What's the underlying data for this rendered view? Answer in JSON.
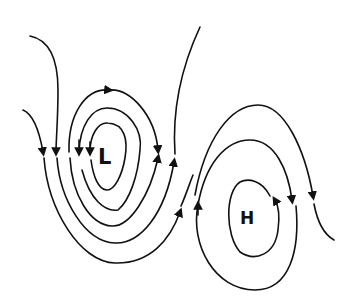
{
  "diagram": {
    "type": "pressure-systems-streamlines",
    "systems": [
      {
        "label": "L",
        "meaning": "low pressure",
        "x": 107,
        "y": 157
      },
      {
        "label": "H",
        "meaning": "high pressure",
        "x": 249,
        "y": 224
      }
    ],
    "colors": {
      "line": "#111111",
      "background": "#ffffff"
    }
  }
}
